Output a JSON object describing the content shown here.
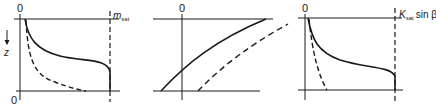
{
  "figure": {
    "panels": [
      {
        "id": "left",
        "origin_top_label": "0",
        "origin_bottom_label": "0",
        "axis_label": "z",
        "axis_arrow": "down-arrow",
        "right_label_main": "m",
        "right_label_sub": "sat",
        "curves": [
          "solid",
          "dashed"
        ]
      },
      {
        "id": "middle",
        "origin_top_label": "0",
        "curves": [
          "solid",
          "dashed"
        ]
      },
      {
        "id": "right",
        "origin_top_label": "0",
        "right_label_main": "K",
        "right_label_sub": "sat",
        "right_label_suffix": "sin β",
        "curves": [
          "solid",
          "dashed"
        ]
      }
    ],
    "line_color": "#1a1a1a",
    "background": "#ffffff"
  }
}
